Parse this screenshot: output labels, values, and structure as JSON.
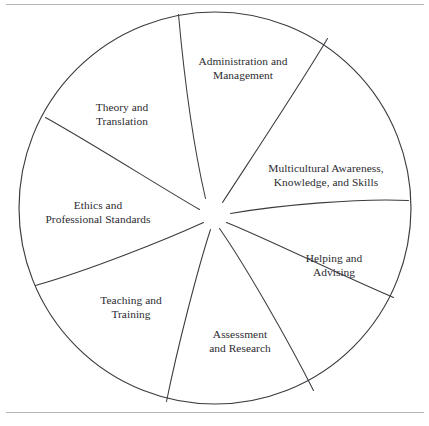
{
  "figure": {
    "type": "pinwheel-wheel-diagram",
    "title": "",
    "background_color": "#ffffff",
    "line_color": "#3b3b41",
    "text_color": "#2b2b30",
    "rule_color": "#b4b4b4",
    "circle": {
      "cx": 215,
      "cy": 208,
      "r": 196
    },
    "hub": {
      "cx": 212,
      "cy": 214,
      "r": 16
    },
    "segment_count": 8
  },
  "rules": {
    "top_label": "top-divider-rule",
    "bottom_label": "bottom-divider-rule"
  },
  "segments": [
    {
      "id": "administration-and-management",
      "lines": [
        "Administration and",
        "Management"
      ],
      "label_x": 243,
      "label_y": 68
    },
    {
      "id": "multicultural-awareness-knowledge-and-skills",
      "lines": [
        "Multicultural Awareness,",
        "Knowledge, and Skills"
      ],
      "label_x": 326,
      "label_y": 175
    },
    {
      "id": "helping-and-advising",
      "lines": [
        "Helping and",
        "Advising"
      ],
      "label_x": 334,
      "label_y": 265
    },
    {
      "id": "assessment-and-research",
      "lines": [
        "Assessment",
        "and Research"
      ],
      "label_x": 240,
      "label_y": 341
    },
    {
      "id": "teaching-and-training",
      "lines": [
        "Teaching and",
        "Training"
      ],
      "label_x": 131,
      "label_y": 307
    },
    {
      "id": "ethics-and-professional-standards",
      "lines": [
        "Ethics and",
        "Professional Standards"
      ],
      "label_x": 98,
      "label_y": 212
    },
    {
      "id": "theory-and-translation",
      "lines": [
        "Theory and",
        "Translation"
      ],
      "label_x": 122,
      "label_y": 114
    }
  ],
  "spokes": [
    {
      "id": "spoke-1",
      "path": "M 178.5 14.5 C 183.5 70 192 140 205.5 198.5"
    },
    {
      "id": "spoke-2",
      "path": "M 327.5 38.5 C 300 85 250 160 222.5 202.5"
    },
    {
      "id": "spoke-3",
      "path": "M 408.5 200.5 C 360 198 280 205 230.5 213.5"
    },
    {
      "id": "spoke-4",
      "path": "M 393.5 297.5 C 340 275 270 240 226.5 222.5"
    },
    {
      "id": "spoke-5",
      "path": "M 313.5 390.5 C 288 340 245 265 219.5 228.5"
    },
    {
      "id": "spoke-6",
      "path": "M 166.5 401.5 C 178 345 198 268 210.5 229.5"
    },
    {
      "id": "spoke-7",
      "path": "M 35.5 285.5 C 90 270 165 240 203.5 222.5"
    },
    {
      "id": "spoke-8",
      "path": "M 45.5 117.5 C 95 145 165 190 199.5 209.5"
    }
  ]
}
